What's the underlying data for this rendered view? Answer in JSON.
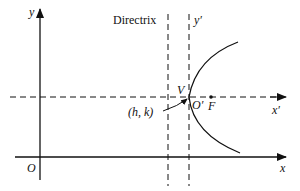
{
  "diagram": {
    "type": "parabola-translated-axes",
    "labels": {
      "y_axis": "y",
      "x_axis": "x",
      "origin": "O",
      "directrix": "Directrix",
      "y_prime": "y′",
      "x_prime": "x′",
      "vertex": "V",
      "new_origin": "O′",
      "focus": "F",
      "vertex_coords": "(h, k)"
    },
    "colors": {
      "line": "#111111",
      "background": "#ffffff"
    }
  }
}
